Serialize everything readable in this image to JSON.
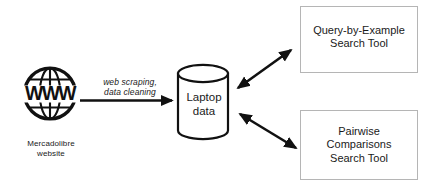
{
  "diagram": {
    "type": "flow-diagram",
    "background_color": "#ffffff",
    "stroke_color": "#1a1a1a",
    "box_border_color": "#b3b3b3",
    "nodes": {
      "source": {
        "icon": "www-globe-icon",
        "label": "Mercadolibre\nwebsite"
      },
      "datastore": {
        "shape": "cylinder",
        "label": "Laptop\ndata"
      },
      "tool_top": {
        "shape": "rectangle",
        "label": "Query-by-Example\nSearch Tool"
      },
      "tool_bottom": {
        "shape": "rectangle",
        "label": "Pairwise\nComparisons\nSearch Tool"
      }
    },
    "edges": {
      "ingest": {
        "label": "web scraping,\ndata cleaning",
        "direction": "one-way",
        "from": "source",
        "to": "datastore"
      },
      "store_to_tool_top": {
        "label": "",
        "direction": "two-way",
        "from": "datastore",
        "to": "tool_top"
      },
      "store_to_tool_bottom": {
        "label": "",
        "direction": "two-way",
        "from": "datastore",
        "to": "tool_bottom"
      }
    }
  }
}
